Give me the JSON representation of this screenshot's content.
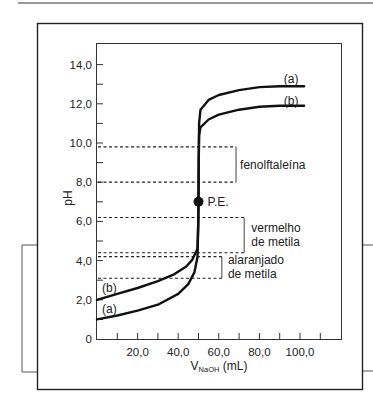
{
  "chart_data": {
    "type": "line",
    "title": "",
    "xlabel": "V_NaOH (mL)",
    "xlabel_main": "V",
    "xlabel_sub": "NaOH",
    "xlabel_unit": " (mL)",
    "ylabel": "pH",
    "xlim": [
      0,
      115
    ],
    "ylim": [
      0,
      15
    ],
    "grid": false,
    "x_ticks": [
      10,
      20,
      30,
      40,
      50,
      60,
      70,
      80,
      90,
      100,
      110
    ],
    "x_tick_labels": [
      {
        "value": 20,
        "label": "20,0"
      },
      {
        "value": 40,
        "label": "40,0"
      },
      {
        "value": 60,
        "label": "60,0"
      },
      {
        "value": 80,
        "label": "80,0"
      },
      {
        "value": 100,
        "label": "100,0"
      }
    ],
    "y_ticks": [
      1,
      2,
      3,
      4,
      5,
      6,
      7,
      8,
      9,
      10,
      11,
      12,
      13,
      14
    ],
    "y_tick_labels": [
      {
        "value": 0,
        "label": "0"
      },
      {
        "value": 2,
        "label": "2,0"
      },
      {
        "value": 4,
        "label": "4,0"
      },
      {
        "value": 6,
        "label": "6,0"
      },
      {
        "value": 8,
        "label": "8,0"
      },
      {
        "value": 10,
        "label": "10,0"
      },
      {
        "value": 12,
        "label": "12,0"
      },
      {
        "value": 14,
        "label": "14,0"
      }
    ],
    "series": [
      {
        "name": "(a)",
        "label_pos_start": {
          "x": 2.5,
          "y": 1.55
        },
        "label_pos_end": {
          "x": 92,
          "y": 13.25
        },
        "points": [
          [
            0,
            1.0
          ],
          [
            10,
            1.2
          ],
          [
            20,
            1.45
          ],
          [
            30,
            1.75
          ],
          [
            40,
            2.3
          ],
          [
            45,
            2.8
          ],
          [
            48,
            3.4
          ],
          [
            49.5,
            4.2
          ],
          [
            49.9,
            6.0
          ],
          [
            50,
            7.0
          ],
          [
            50.1,
            9.0
          ],
          [
            50.3,
            11.0
          ],
          [
            51,
            11.7
          ],
          [
            55,
            12.2
          ],
          [
            60,
            12.45
          ],
          [
            70,
            12.7
          ],
          [
            80,
            12.85
          ],
          [
            90,
            12.9
          ],
          [
            102,
            12.9
          ]
        ]
      },
      {
        "name": "(b)",
        "label_pos_start": {
          "x": 2.5,
          "y": 2.6
        },
        "label_pos_end": {
          "x": 92,
          "y": 12.15
        },
        "points": [
          [
            0,
            2.0
          ],
          [
            10,
            2.3
          ],
          [
            20,
            2.6
          ],
          [
            30,
            2.95
          ],
          [
            38,
            3.3
          ],
          [
            44,
            3.7
          ],
          [
            47,
            4.05
          ],
          [
            49.5,
            4.6
          ],
          [
            49.9,
            6.0
          ],
          [
            50,
            7.0
          ],
          [
            50.1,
            9.0
          ],
          [
            50.3,
            10.4
          ],
          [
            51,
            10.8
          ],
          [
            55,
            11.2
          ],
          [
            60,
            11.45
          ],
          [
            70,
            11.7
          ],
          [
            80,
            11.85
          ],
          [
            90,
            11.9
          ],
          [
            102,
            11.9
          ]
        ]
      }
    ],
    "equivalence_point": {
      "label": "P.E.",
      "x": 50,
      "y": 7.0
    },
    "indicator_ranges": [
      {
        "name": "fenolftaleína",
        "lines": [
          "fenolftaleína"
        ],
        "low": 8.0,
        "high": 9.8,
        "dash_end_x": 68.5,
        "bracket_x": 68.5,
        "label_x": 70.5
      },
      {
        "name": "vermelho de metila",
        "lines": [
          "vermelho",
          "de metila"
        ],
        "low": 4.4,
        "high": 6.2,
        "dash_end_x": 72.5,
        "bracket_x": 72.5,
        "label_x": 76
      },
      {
        "name": "alaranjado de metila",
        "lines": [
          "alaranjado",
          "de metila"
        ],
        "low": 3.1,
        "high": 4.2,
        "dash_end_x": 61.5,
        "bracket_x": 61.5,
        "label_x": 64.5
      }
    ]
  },
  "figure": {
    "ylabel": "pH",
    "pe_label": "P.E."
  }
}
